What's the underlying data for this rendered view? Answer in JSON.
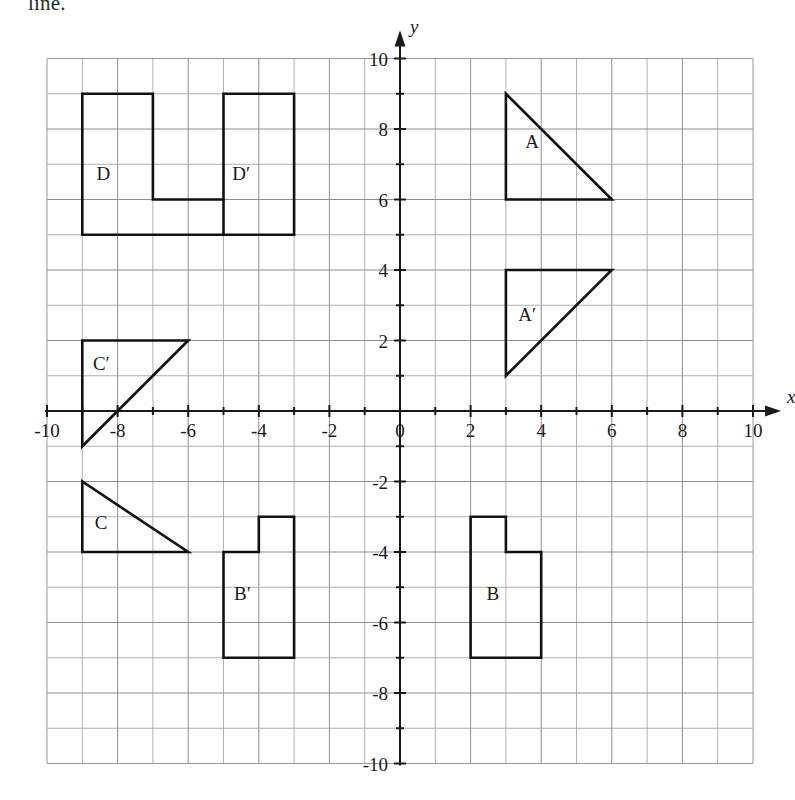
{
  "page": {
    "header_text": "line.",
    "background_color": "#ffffff",
    "ink_color": "#111111",
    "grid_color": "#a8a8a8"
  },
  "chart_data": {
    "type": "scatter",
    "title": "",
    "xlabel": "x",
    "ylabel": "y",
    "xlim": [
      -10,
      10
    ],
    "ylim": [
      -10,
      10
    ],
    "grid": true,
    "grid_step": 1,
    "tick_step": 2,
    "legend": "none",
    "x_tick_labels": [
      "-10",
      "-8",
      "-6",
      "-4",
      "-2",
      "0",
      "2",
      "4",
      "6",
      "8",
      "10"
    ],
    "x_tick_values": [
      -10,
      -8,
      -6,
      -4,
      -2,
      0,
      2,
      4,
      6,
      8,
      10
    ],
    "y_tick_labels": [
      "10",
      "8",
      "6",
      "4",
      "2",
      "-2",
      "-4",
      "-6",
      "-8",
      "-10"
    ],
    "y_tick_values": [
      10,
      8,
      6,
      4,
      2,
      -2,
      -4,
      -6,
      -8,
      -10
    ],
    "origin_label": "0",
    "shapes": [
      {
        "name": "A",
        "label": "A",
        "kind": "triangle",
        "closed": true,
        "points": [
          [
            3,
            9
          ],
          [
            3,
            6
          ],
          [
            6,
            6
          ]
        ],
        "label_at": [
          3.55,
          7.45
        ]
      },
      {
        "name": "A-prime",
        "label": "A′",
        "kind": "triangle",
        "closed": true,
        "points": [
          [
            3,
            4
          ],
          [
            6,
            4
          ],
          [
            3,
            1
          ]
        ],
        "label_at": [
          3.35,
          2.55
        ]
      },
      {
        "name": "B",
        "label": "B",
        "kind": "polygon",
        "closed": true,
        "points": [
          [
            2,
            -3
          ],
          [
            3,
            -3
          ],
          [
            3,
            -4
          ],
          [
            4,
            -4
          ],
          [
            4,
            -7
          ],
          [
            2,
            -7
          ]
        ],
        "label_at": [
          2.45,
          -5.35
        ]
      },
      {
        "name": "B-prime",
        "label": "B′",
        "kind": "polygon",
        "closed": true,
        "points": [
          [
            -3,
            -3
          ],
          [
            -4,
            -3
          ],
          [
            -4,
            -4
          ],
          [
            -5,
            -4
          ],
          [
            -5,
            -7
          ],
          [
            -3,
            -7
          ]
        ],
        "label_at": [
          -4.7,
          -5.35
        ]
      },
      {
        "name": "C",
        "label": "C",
        "kind": "triangle",
        "closed": true,
        "points": [
          [
            -9,
            -2
          ],
          [
            -9,
            -4
          ],
          [
            -6,
            -4
          ]
        ],
        "label_at": [
          -8.65,
          -3.35
        ]
      },
      {
        "name": "C-prime",
        "label": "C′",
        "kind": "triangle",
        "closed": true,
        "points": [
          [
            -9,
            2
          ],
          [
            -6,
            2
          ],
          [
            -9,
            -1
          ]
        ],
        "label_at": [
          -8.7,
          1.15
        ]
      },
      {
        "name": "D-and-D-prime",
        "label": "",
        "kind": "polygon",
        "closed": true,
        "points": [
          [
            -9,
            9
          ],
          [
            -7,
            9
          ],
          [
            -7,
            6
          ],
          [
            -5,
            6
          ],
          [
            -5,
            9
          ],
          [
            -3,
            9
          ],
          [
            -3,
            5
          ],
          [
            -9,
            5
          ]
        ],
        "label_at": null
      },
      {
        "name": "D-divider",
        "label": "",
        "kind": "segment",
        "closed": false,
        "points": [
          [
            -5,
            6
          ],
          [
            -5,
            5
          ]
        ],
        "label_at": null
      }
    ],
    "shape_labels": [
      {
        "name": "D",
        "text": "D",
        "at": [
          -8.6,
          6.55
        ]
      },
      {
        "name": "D-prime",
        "text": "D′",
        "at": [
          -4.75,
          6.55
        ]
      }
    ]
  }
}
